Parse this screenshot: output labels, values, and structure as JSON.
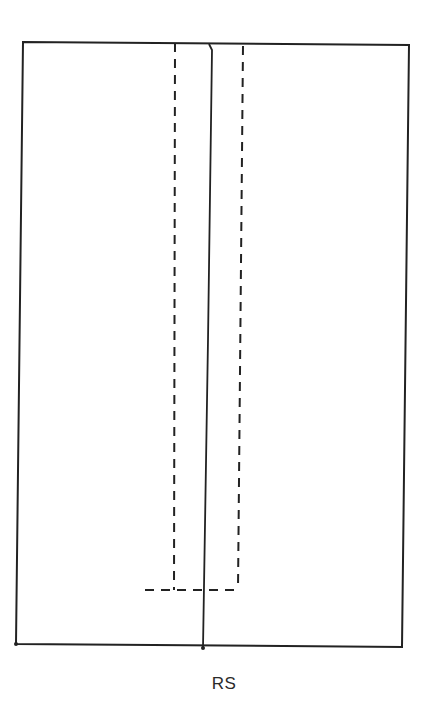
{
  "diagram": {
    "type": "sewing-pattern-piece",
    "caption": "RS",
    "colors": {
      "background": "#ffffff",
      "stroke": "#222222"
    },
    "outline": {
      "top_left": [
        23,
        42
      ],
      "top_right": [
        409,
        45
      ],
      "bottom_right": [
        402,
        647
      ],
      "bottom_left": [
        16,
        644
      ],
      "stroke_width": 2
    },
    "center_line": {
      "style": "solid",
      "points": [
        [
          209,
          44
        ],
        [
          212,
          50
        ],
        [
          208,
          340
        ],
        [
          203,
          648
        ]
      ],
      "stroke_width": 1.8
    },
    "dashed_slit": {
      "style": "dashed",
      "left_edge": {
        "from": [
          175,
          43
        ],
        "to": [
          174,
          590
        ]
      },
      "right_edge": {
        "from": [
          243,
          46
        ],
        "to": [
          238,
          590
        ]
      },
      "bottom_edge": {
        "from": [
          145,
          590
        ],
        "to": [
          238,
          590
        ]
      },
      "dash_pattern": [
        9,
        7
      ],
      "stroke_width": 2
    }
  }
}
